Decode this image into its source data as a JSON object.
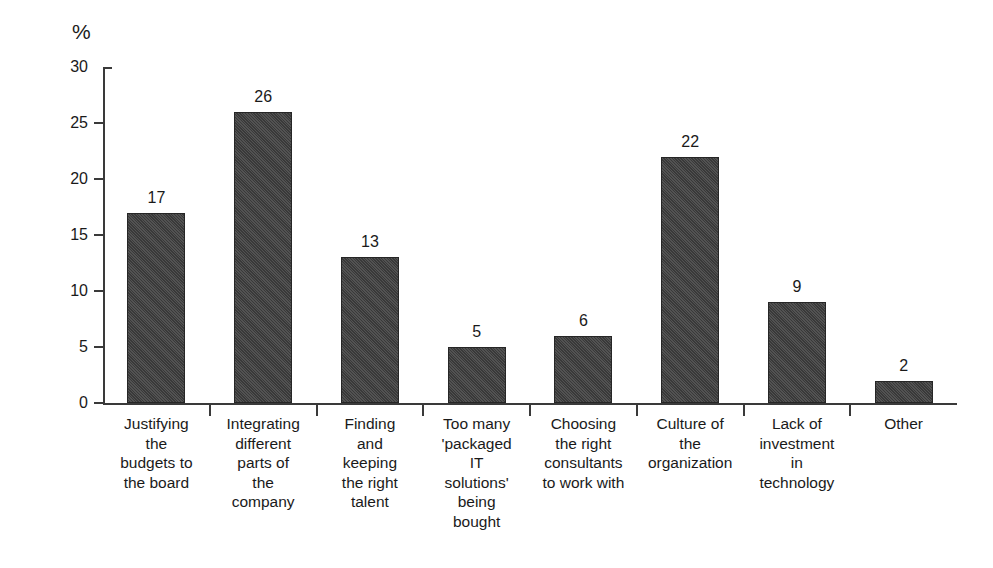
{
  "chart_data": {
    "type": "bar",
    "title": "",
    "xlabel": "",
    "ylabel": "%",
    "ylim": [
      0,
      30
    ],
    "ytick_step": 5,
    "yticks": [
      30,
      25,
      20,
      15,
      10,
      5,
      0
    ],
    "grid": false,
    "legend": null,
    "bar_color": "#3f3f3f",
    "bar_edge_color": "#262626",
    "axis_color": "#3a3a3a",
    "categories": [
      "Justifying\nthe\nbudgets to\nthe board",
      "Integrating\ndifferent\nparts of\nthe\ncompany",
      "Finding\nand\nkeeping\nthe right\ntalent",
      "Too many\n'packaged\nIT\nsolutions'\nbeing\nbought",
      "Choosing\nthe right\nconsultants\nto work with",
      "Culture of\nthe\norganization",
      "Lack of\ninvestment\nin\ntechnology",
      "Other"
    ],
    "values": [
      17,
      26,
      13,
      5,
      6,
      22,
      9,
      2
    ],
    "value_labels": [
      "17",
      "26",
      "13",
      "5",
      "6",
      "22",
      "9",
      "2"
    ]
  }
}
